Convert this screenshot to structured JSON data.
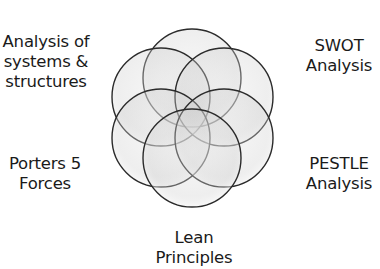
{
  "diagram": {
    "type": "overlapping-circles",
    "circle_count": 6,
    "colors": {
      "circle_fill": "#d9d9d9",
      "circle_stroke": "#2b2b2b",
      "background": "#ffffff",
      "text": "#1a1a1a"
    },
    "labels": {
      "top_left": [
        "Analysis of",
        "systems &",
        "structures"
      ],
      "top_right": [
        "SWOT",
        "Analysis"
      ],
      "bottom_left": [
        "Porters 5",
        "Forces"
      ],
      "bottom_right": [
        "PESTLE",
        "Analysis"
      ],
      "bottom": [
        "Lean",
        "Principles"
      ]
    }
  }
}
